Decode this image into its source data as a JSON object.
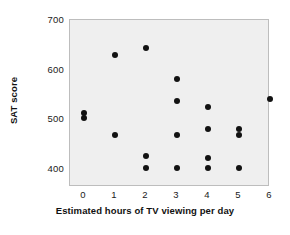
{
  "chart_data": {
    "type": "scatter",
    "title": "",
    "xlabel": "Estimated hours of TV viewing per day",
    "ylabel": "SAT score",
    "xlim": [
      -0.45,
      6.0
    ],
    "ylim": [
      363,
      700
    ],
    "xticks": [
      0,
      1,
      2,
      3,
      4,
      5,
      6
    ],
    "xtick_labels": [
      "0",
      "1",
      "2",
      "3",
      "4",
      "5",
      "6"
    ],
    "yticks": [
      400,
      500,
      600,
      700
    ],
    "ytick_labels": [
      "400",
      "500",
      "600",
      "700"
    ],
    "grid": false,
    "legend": null,
    "marker": "filled-circle",
    "marker_color": "#121212",
    "panel_background": "#efefef",
    "panel_border": "#bdbdbd",
    "points": [
      {
        "x": 0,
        "y": 513
      },
      {
        "x": 0,
        "y": 502
      },
      {
        "x": 1,
        "y": 630
      },
      {
        "x": 1,
        "y": 467
      },
      {
        "x": 2,
        "y": 643
      },
      {
        "x": 2,
        "y": 425
      },
      {
        "x": 2,
        "y": 401
      },
      {
        "x": 3,
        "y": 581
      },
      {
        "x": 3,
        "y": 537
      },
      {
        "x": 3,
        "y": 467
      },
      {
        "x": 3,
        "y": 402
      },
      {
        "x": 4,
        "y": 525
      },
      {
        "x": 4,
        "y": 481
      },
      {
        "x": 4,
        "y": 421
      },
      {
        "x": 4,
        "y": 402
      },
      {
        "x": 5,
        "y": 481
      },
      {
        "x": 5,
        "y": 468
      },
      {
        "x": 5,
        "y": 401
      },
      {
        "x": 6,
        "y": 540
      }
    ]
  }
}
